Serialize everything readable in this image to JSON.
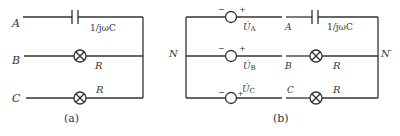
{
  "figure_a": {
    "caption": "(a)",
    "nodes": [
      "A",
      "B",
      "C"
    ],
    "components": [
      {
        "branch": "A",
        "type": "capacitor",
        "label": "1/jωC"
      },
      {
        "branch": "B",
        "type": "lamp",
        "label": "R"
      },
      {
        "branch": "C",
        "type": "lamp",
        "label": "R"
      }
    ]
  },
  "figure_b": {
    "caption": "(b)",
    "left_node": "N",
    "right_node": "N′",
    "sources": [
      {
        "label": "U̇",
        "sub": "A",
        "minus": "−",
        "plus": "+"
      },
      {
        "label": "U̇",
        "sub": "B",
        "minus": "−",
        "plus": "+"
      },
      {
        "label": "U̇",
        "sub": "C",
        "minus": "−",
        "plus": "+"
      }
    ],
    "line_labels": [
      "A",
      "B",
      "C"
    ],
    "components": [
      {
        "branch": "A",
        "type": "capacitor",
        "label": "1/jωC"
      },
      {
        "branch": "B",
        "type": "lamp",
        "label": "R"
      },
      {
        "branch": "C",
        "type": "lamp",
        "label": "R"
      }
    ]
  }
}
